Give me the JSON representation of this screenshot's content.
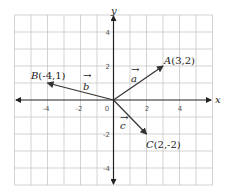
{
  "diagram": {
    "axes": {
      "x_label": "x",
      "y_label": "y",
      "x_range": [
        -6,
        6
      ],
      "y_range": [
        -5,
        5
      ],
      "x_ticks": [
        "-4",
        "-2",
        "0",
        "2",
        "4"
      ],
      "y_ticks": [
        "4",
        "2",
        "-2",
        "-4"
      ]
    },
    "points": [
      {
        "name": "A",
        "coords": "(3,2)",
        "x": 3,
        "y": 2
      },
      {
        "name": "B",
        "coords": "(-4,1)",
        "x": -4,
        "y": 1
      },
      {
        "name": "C",
        "coords": "(2,-2)",
        "x": 2,
        "y": -2
      }
    ],
    "vectors": [
      {
        "name": "a",
        "to": "A"
      },
      {
        "name": "b",
        "to": "B"
      },
      {
        "name": "c",
        "to": "C"
      }
    ],
    "vector_arrow": "→"
  }
}
